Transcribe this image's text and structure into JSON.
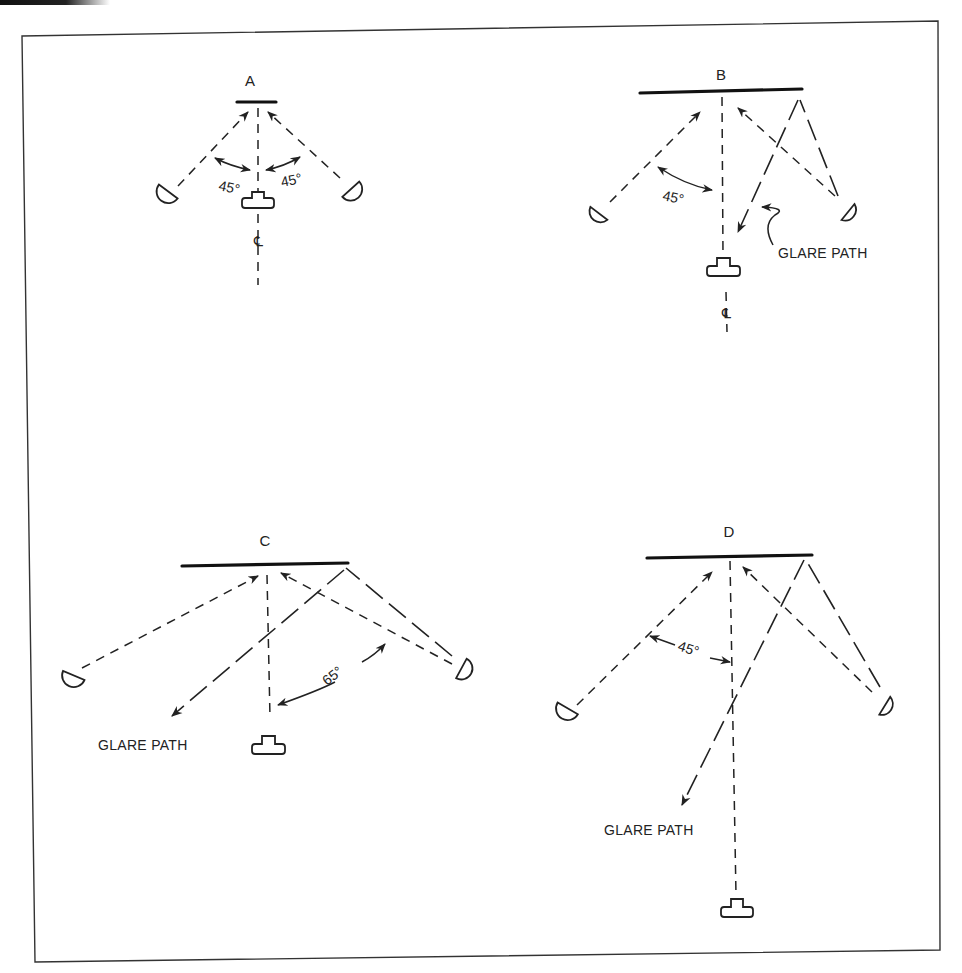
{
  "figure": {
    "caption_partial": ""
  },
  "panels": [
    {
      "id": "A",
      "label": "A",
      "angles": [
        "45°",
        "45°"
      ],
      "centerline_symbol": "℄",
      "glare_label": ""
    },
    {
      "id": "B",
      "label": "B",
      "angles": [
        "45°"
      ],
      "centerline_symbol": "℄",
      "glare_label": "GLARE PATH"
    },
    {
      "id": "C",
      "label": "C",
      "angles": [
        "65°"
      ],
      "centerline_symbol": "",
      "glare_label": "GLARE PATH"
    },
    {
      "id": "D",
      "label": "D",
      "angles": [
        "45°"
      ],
      "centerline_symbol": "",
      "glare_label": "GLARE PATH"
    }
  ],
  "legend": {
    "screen": "subject-plane (thick bar)",
    "light": "lamp (half-disc)",
    "camera": "camera (T-shape)"
  }
}
